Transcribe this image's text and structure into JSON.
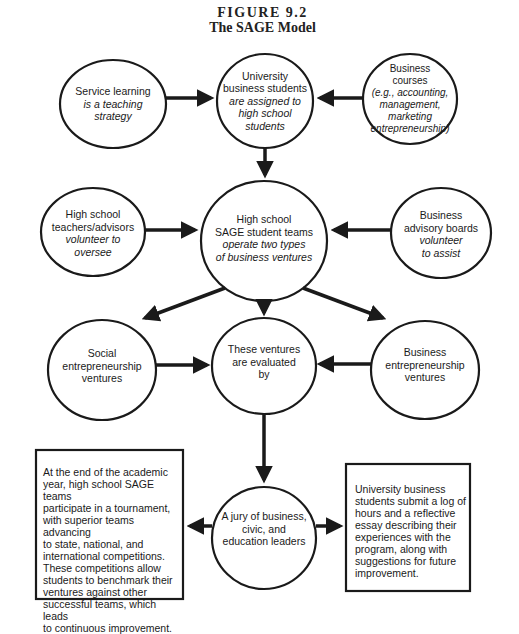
{
  "figure": {
    "label": "FIGURE 9.2",
    "title": "The SAGE Model"
  },
  "nodes": {
    "service_learning": {
      "main": "Service learning",
      "sub": [
        "is a teaching",
        "strategy"
      ]
    },
    "university_students": {
      "main": [
        "University",
        "business students"
      ],
      "sub": [
        "are assigned to",
        "high school",
        "students"
      ]
    },
    "business_courses": {
      "main": [
        "Business",
        "courses"
      ],
      "sub": [
        "(e.g., accounting,",
        "management,",
        "marketing",
        "entrepreneurship)"
      ]
    },
    "hs_teachers": {
      "main": [
        "High school",
        "teachers/advisors"
      ],
      "sub": [
        "volunteer to",
        "oversee"
      ]
    },
    "sage_teams": {
      "main": [
        "High school",
        "SAGE student teams"
      ],
      "sub": [
        "operate two types",
        "of business ventures"
      ]
    },
    "advisory_boards": {
      "main": [
        "Business",
        "advisory boards"
      ],
      "sub": [
        "volunteer",
        "to assist"
      ]
    },
    "social_ventures": {
      "main": [
        "Social",
        "entrepreneurship",
        "ventures"
      ]
    },
    "evaluated": {
      "main": [
        "These ventures",
        "are evaluated",
        "by"
      ]
    },
    "business_ventures": {
      "main": [
        "Business",
        "entrepreneurship",
        "ventures"
      ]
    },
    "jury": {
      "main": [
        "A jury of business,",
        "civic, and",
        "education leaders"
      ]
    }
  },
  "boxes": {
    "tournament": {
      "lines": [
        "At the end of the academic",
        "year, high school SAGE teams",
        "participate in a tournament,",
        "with superior teams advancing",
        "to state, national, and",
        "international competitions.",
        "These competitions allow",
        "students to benchmark their",
        "ventures against other",
        "successful teams, which leads",
        "to continuous improvement."
      ]
    },
    "log": {
      "lines": [
        "University business",
        "students submit a log of",
        "hours and a reflective",
        "essay describing their",
        "experiences with the",
        "program, along with",
        "suggestions for future",
        "improvement."
      ]
    }
  },
  "edges": [
    {
      "from": "service_learning",
      "to": "university_students"
    },
    {
      "from": "business_courses",
      "to": "university_students"
    },
    {
      "from": "university_students",
      "to": "sage_teams"
    },
    {
      "from": "hs_teachers",
      "to": "sage_teams"
    },
    {
      "from": "advisory_boards",
      "to": "sage_teams"
    },
    {
      "from": "sage_teams",
      "to": "social_ventures"
    },
    {
      "from": "sage_teams",
      "to": "evaluated"
    },
    {
      "from": "sage_teams",
      "to": "business_ventures"
    },
    {
      "from": "social_ventures",
      "to": "evaluated"
    },
    {
      "from": "business_ventures",
      "to": "evaluated"
    },
    {
      "from": "evaluated",
      "to": "jury"
    },
    {
      "from": "jury",
      "to": "tournament"
    },
    {
      "from": "jury",
      "to": "log"
    }
  ],
  "colors": {
    "stroke": "#1a1a1a",
    "background": "#ffffff"
  }
}
